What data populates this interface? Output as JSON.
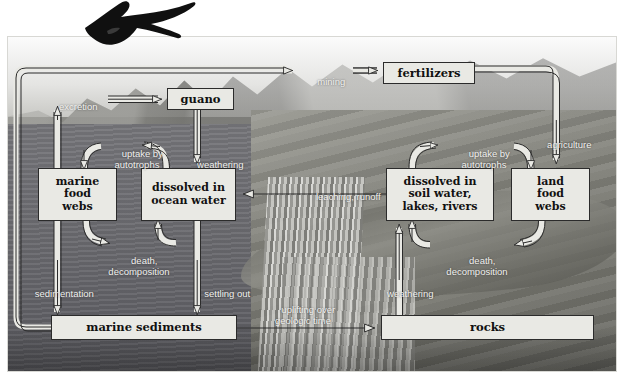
{
  "figure": {
    "background_description": "greyscale photograph of coastal mountains, ocean and waterfall",
    "decoration_icon": "frigatebird-icon"
  },
  "palette": {
    "box_fill": "#e9e9e4",
    "box_border": "#2b2b2b",
    "box_text": "#111111",
    "label_text": "#f2f2f0",
    "arrow_fill": "#e9e9e4",
    "arrow_stroke": "#2b2b2b"
  },
  "nodes": [
    {
      "id": "guano",
      "label": "guano",
      "x": 167,
      "y": 88,
      "w": 67,
      "h": 22
    },
    {
      "id": "fertilizers",
      "label": "fertilizers",
      "x": 383,
      "y": 62,
      "w": 92,
      "h": 22
    },
    {
      "id": "marine-food-webs",
      "label": "marine\nfood\nwebs",
      "x": 38,
      "y": 168,
      "w": 79,
      "h": 53
    },
    {
      "id": "dissolved-ocean",
      "label": "dissolved in\nocean water",
      "x": 141,
      "y": 168,
      "w": 95,
      "h": 53
    },
    {
      "id": "dissolved-soil",
      "label": "dissolved in\nsoil water,\nlakes, rivers",
      "x": 386,
      "y": 168,
      "w": 108,
      "h": 53
    },
    {
      "id": "land-food-webs",
      "label": "land\nfood\nwebs",
      "x": 511,
      "y": 168,
      "w": 79,
      "h": 53
    },
    {
      "id": "marine-sediments",
      "label": "marine sediments",
      "x": 51,
      "y": 315,
      "w": 186,
      "h": 25
    },
    {
      "id": "rocks",
      "label": "rocks",
      "x": 381,
      "y": 315,
      "w": 213,
      "h": 25
    }
  ],
  "flow_labels": [
    {
      "id": "excretion",
      "text": "excretion",
      "x": 42,
      "y": 90,
      "w": 62
    },
    {
      "id": "mining",
      "text": "mining",
      "x": 302,
      "y": 65,
      "w": 48
    },
    {
      "id": "weathering-guano",
      "text": "weathering",
      "x": 184,
      "y": 148,
      "w": 62
    },
    {
      "id": "agriculture",
      "text": "agriculture",
      "x": 533,
      "y": 128,
      "w": 62
    },
    {
      "id": "uptake-autotrophs-marine",
      "text": "uptake by\nautotrophs",
      "x": 103,
      "y": 137,
      "w": 68
    },
    {
      "id": "uptake-autotrophs-land",
      "text": "uptake by\nautotrophs",
      "x": 450,
      "y": 137,
      "w": 68
    },
    {
      "id": "leaching-runoff",
      "text": "leaching, runoff",
      "x": 297,
      "y": 180,
      "w": 92
    },
    {
      "id": "death-decomposition-marine",
      "text": "death,\ndecomposition",
      "x": 99,
      "y": 244,
      "w": 80
    },
    {
      "id": "death-decomposition-land",
      "text": "death,\ndecomposition",
      "x": 437,
      "y": 244,
      "w": 80
    },
    {
      "id": "sedimentation",
      "text": "sedimentation",
      "x": 16,
      "y": 277,
      "w": 86
    },
    {
      "id": "settling-out",
      "text": "settling out",
      "x": 186,
      "y": 277,
      "w": 72
    },
    {
      "id": "weathering-rocks",
      "text": "weathering",
      "x": 372,
      "y": 277,
      "w": 66
    },
    {
      "id": "uplifting-geologic-time",
      "text": "uplifting over\ngeologic time",
      "x": 260,
      "y": 293,
      "w": 86
    }
  ],
  "connections": [
    {
      "id": "marine-sediments-to-mining",
      "from": "marine sediments",
      "to": "mining",
      "label": "mining"
    },
    {
      "id": "mining-to-fertilizers",
      "from": "mining",
      "to": "fertilizers",
      "label": "mining"
    },
    {
      "id": "marine-food-webs-to-guano",
      "from": "marine food webs",
      "to": "guano",
      "label": "excretion"
    },
    {
      "id": "guano-to-dissolved-ocean",
      "from": "guano",
      "to": "dissolved in ocean water",
      "label": "weathering"
    },
    {
      "id": "fertilizers-to-land-food",
      "from": "fertilizers",
      "to": "land food webs",
      "label": "agriculture"
    },
    {
      "id": "ocean-to-marine-food-webs",
      "from": "dissolved in ocean water",
      "to": "marine food webs",
      "label": "uptake by autotrophs"
    },
    {
      "id": "soil-to-land-food-webs",
      "from": "dissolved in soil water, lakes, rivers",
      "to": "land food webs",
      "label": "uptake by autotrophs"
    },
    {
      "id": "soil-to-ocean",
      "from": "dissolved in soil water, lakes, rivers",
      "to": "dissolved in ocean water",
      "label": "leaching, runoff"
    },
    {
      "id": "marine-food-webs-to-ocean",
      "from": "marine food webs",
      "to": "dissolved in ocean water",
      "label": "death, decomposition"
    },
    {
      "id": "land-food-webs-to-soil",
      "from": "land food webs",
      "to": "dissolved in soil water, lakes, rivers",
      "label": "death, decomposition"
    },
    {
      "id": "marine-food-webs-to-sediments",
      "from": "marine food webs",
      "to": "marine sediments",
      "label": "sedimentation"
    },
    {
      "id": "ocean-to-sediments",
      "from": "dissolved in ocean water",
      "to": "marine sediments",
      "label": "settling out"
    },
    {
      "id": "rocks-to-soil",
      "from": "rocks",
      "to": "dissolved in soil water, lakes, rivers",
      "label": "weathering"
    },
    {
      "id": "sediments-to-rocks",
      "from": "marine sediments",
      "to": "rocks",
      "label": "uplifting over geologic time"
    }
  ]
}
